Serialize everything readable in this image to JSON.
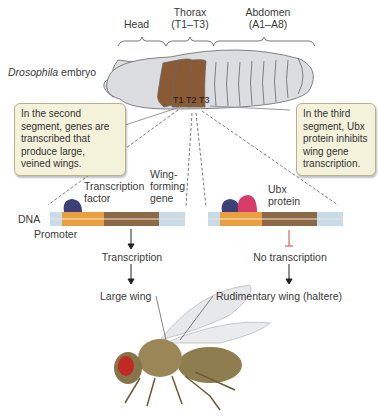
{
  "diagram": {
    "regions": {
      "head": "Head",
      "thorax": "Thorax",
      "thorax_range": "(T1–T3)",
      "abdomen": "Abdomen",
      "abdomen_range": "(A1–A8)"
    },
    "embryo_label_italic": "Drosophila",
    "embryo_label_rest": " embryo",
    "segments": [
      "T1",
      "T2",
      "T3"
    ],
    "callout_left": "In the second\nsegment, genes are\ntranscribed that\nproduce large,\nveined wings.",
    "callout_right": "In the third\nsegment, Ubx\nprotein inhibits\nwing gene\ntranscription.",
    "left_panel": {
      "transcription_factor": "Transcription\nfactor",
      "wing_gene": "Wing-\nforming\ngene",
      "dna": "DNA",
      "promoter": "Promoter",
      "result": "Transcription",
      "outcome": "Large wing"
    },
    "right_panel": {
      "ubx": "Ubx\nprotein",
      "result": "No transcription",
      "outcome": "Rudimentary wing (haltere)"
    },
    "colors": {
      "segment_brown": "#8a5a35",
      "embryo_gray": "#dcdde0",
      "promoter_orange": "#e8a040",
      "gene_brown": "#8c6a48",
      "dna_end_blue": "#c8dbe8",
      "tf_navy": "#3c3f78",
      "ubx_pink": "#d63b6a",
      "callout_bg": "#f5f2dc",
      "inhibit_red": "#c84a3a"
    }
  }
}
